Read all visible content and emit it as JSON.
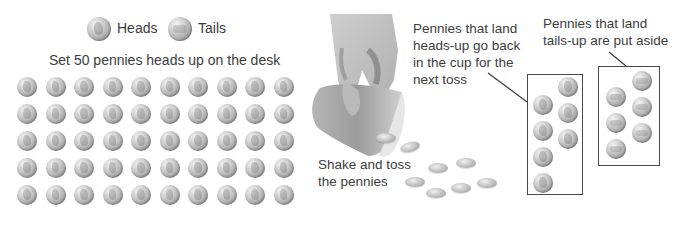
{
  "legend": {
    "heads_label": "Heads",
    "tails_label": "Tails",
    "heads_icon": "heads-penny-icon",
    "tails_icon": "tails-penny-icon"
  },
  "grid": {
    "title": "Set 50 pennies heads up on the desk",
    "rows": 5,
    "cols": 10,
    "coin_side": "heads"
  },
  "toss": {
    "illustration": "hand-tipping-cup",
    "caption_line1": "Shake and toss",
    "caption_line2": "the pennies",
    "tossed_coin_count": 8
  },
  "heads_group": {
    "caption_line1": "Pennies that land",
    "caption_line2": "heads-up go back",
    "caption_line3": "in the cup for the",
    "caption_line4": "next toss",
    "coin_count": 8
  },
  "tails_group": {
    "caption_line1": "Pennies that land",
    "caption_line2": "tails-up are put aside",
    "coin_count": 6
  },
  "colors": {
    "text": "#3c3c3c",
    "box_border": "#4a4a4a",
    "coin_light": "#f4f4f4",
    "coin_dark": "#8a8a8a",
    "cup": "#9a9a9a"
  }
}
